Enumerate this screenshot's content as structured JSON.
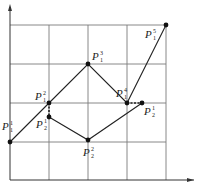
{
  "diagram": {
    "grid": {
      "x_lines": [
        10,
        49,
        88,
        127,
        166
      ],
      "y_lines": [
        25,
        64,
        103,
        142,
        180
      ]
    },
    "axes": {
      "origin": [
        10,
        180
      ],
      "x_end": [
        194,
        180
      ],
      "y_end": [
        10,
        4
      ]
    },
    "colors": {
      "grid": "#7a7a7a",
      "line": "#222222",
      "background": "#ffffff"
    },
    "points": [
      {
        "id": "P1_1",
        "base": "P",
        "sub": "1",
        "sup": "1",
        "x": 10,
        "y": 142,
        "label_x": 2,
        "label_y": 130
      },
      {
        "id": "P1_2",
        "base": "P",
        "sub": "1",
        "sup": "2",
        "x": 49,
        "y": 103,
        "label_x": 35,
        "label_y": 100
      },
      {
        "id": "P1_3",
        "base": "P",
        "sub": "1",
        "sup": "3",
        "x": 88,
        "y": 64,
        "label_x": 92,
        "label_y": 60
      },
      {
        "id": "P1_4",
        "base": "P",
        "sub": "1",
        "sup": "4",
        "x": 127,
        "y": 103,
        "label_x": 116,
        "label_y": 97
      },
      {
        "id": "P1_5",
        "base": "P",
        "sub": "1",
        "sup": "5",
        "x": 166,
        "y": 25,
        "label_x": 145,
        "label_y": 38
      },
      {
        "id": "P2_1",
        "base": "P",
        "sub": "2",
        "sup": "1",
        "x": 142,
        "y": 103,
        "label_x": 144,
        "label_y": 115
      },
      {
        "id": "P2_2",
        "base": "P",
        "sub": "2",
        "sup": "1",
        "x": 49,
        "y": 117,
        "label_x": 36,
        "label_y": 128
      },
      {
        "id": "P2_3",
        "base": "P",
        "sub": "2",
        "sup": "2",
        "x": 88,
        "y": 140,
        "label_x": 83,
        "label_y": 156
      }
    ],
    "p1_path": "10,142 49,103 88,64 127,103 166,25",
    "p2_path": "49,117 88,140 142,103",
    "dashed_links": [
      {
        "from": [
          49,
          103
        ],
        "to": [
          49,
          117
        ]
      },
      {
        "from": [
          127,
          103
        ],
        "to": [
          142,
          103
        ]
      }
    ]
  }
}
